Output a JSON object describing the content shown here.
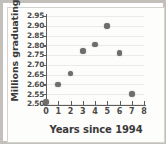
{
  "chart_data": {
    "type": "scatter",
    "title": "",
    "xlabel": "Years since 1994",
    "ylabel": "Millions graduating",
    "x": [
      0,
      1,
      2,
      3,
      4,
      5,
      6,
      7
    ],
    "values": [
      2.51,
      2.6,
      2.655,
      2.77,
      2.805,
      2.9,
      2.76,
      2.55
    ],
    "points": [
      {
        "x": 0,
        "y": 2.51
      },
      {
        "x": 1,
        "y": 2.6
      },
      {
        "x": 2,
        "y": 2.655
      },
      {
        "x": 3,
        "y": 2.77
      },
      {
        "x": 4,
        "y": 2.805
      },
      {
        "x": 5,
        "y": 2.9
      },
      {
        "x": 6,
        "y": 2.76
      },
      {
        "x": 7,
        "y": 2.55
      }
    ],
    "xlim": [
      0,
      8
    ],
    "ylim": [
      2.5,
      2.95
    ],
    "xticks": [
      0,
      1,
      2,
      3,
      4,
      5,
      6,
      7,
      8
    ],
    "xtick_labels": [
      "0",
      "1",
      "2",
      "3",
      "4",
      "5",
      "6",
      "7",
      "8"
    ],
    "yticks": [
      2.5,
      2.55,
      2.6,
      2.65,
      2.7,
      2.75,
      2.8,
      2.85,
      2.9,
      2.95
    ],
    "ytick_labels": [
      "2.50",
      "2.55",
      "2.60",
      "2.65",
      "2.70",
      "2.75",
      "2.80",
      "2.85",
      "2.90",
      "2.95"
    ],
    "grid": true,
    "grid_axis": "y",
    "legend": null,
    "marker_color": "#6e6e6e",
    "axis_color": "#5d5d5d",
    "grid_color": "#eceae7",
    "background_color": "#fdfdfc",
    "frame_color": "#c3c0bc"
  }
}
